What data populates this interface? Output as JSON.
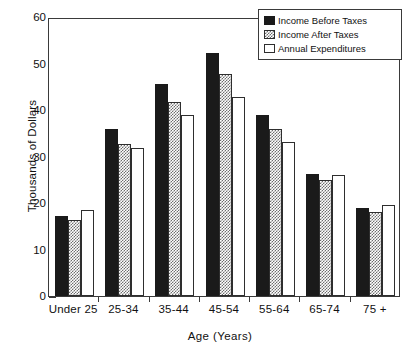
{
  "chart_data": {
    "type": "bar",
    "title": "",
    "xlabel": "Age (Years)",
    "ylabel": "Thousands of Dollars",
    "categories": [
      "Under 25",
      "25-34",
      "35-44",
      "45-54",
      "55-64",
      "65-74",
      "75 +"
    ],
    "series": [
      {
        "name": "Income Before Taxes",
        "style": "solid-black",
        "color": "#1a1a1a",
        "values": [
          17.3,
          36.0,
          45.5,
          52.3,
          39.0,
          26.2,
          19.0
        ]
      },
      {
        "name": "Income After Taxes",
        "style": "checkered-gray",
        "color": "#6e6e6e",
        "values": [
          16.3,
          32.6,
          41.7,
          47.7,
          35.9,
          24.9,
          18.1
        ]
      },
      {
        "name": "Annual Expenditures",
        "style": "open-white",
        "color": "#ffffff",
        "values": [
          18.6,
          31.8,
          39.0,
          42.7,
          33.2,
          26.1,
          19.5
        ]
      }
    ],
    "ylim": [
      0,
      60
    ],
    "ytick_labels": [
      "0",
      "10",
      "20",
      "30",
      "40",
      "50",
      "60"
    ],
    "ytick_values": [
      0,
      10,
      20,
      30,
      40,
      50,
      60
    ],
    "yminor_step": 2,
    "grid": false,
    "legend_position": "top-right",
    "frame": true,
    "axis_color": "#3a3a3a"
  },
  "legend": {
    "entries": [
      {
        "label": "Income Before Taxes"
      },
      {
        "label": "Income After Taxes"
      },
      {
        "label": "Annual Expenditures"
      }
    ]
  }
}
